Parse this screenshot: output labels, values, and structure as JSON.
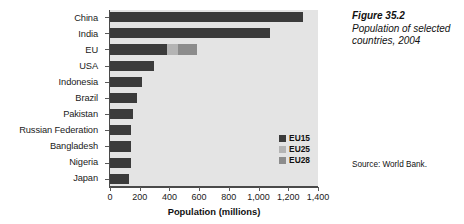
{
  "figure": {
    "number": "Figure 35.2",
    "title": "Population of selected countries, 2004",
    "source": "Source: World Bank."
  },
  "legend": {
    "position": "inside-right",
    "items": [
      {
        "label": "EU15",
        "color": "#3b3b3b"
      },
      {
        "label": "EU25",
        "color": "#b4b4b4"
      },
      {
        "label": "EU28",
        "color": "#8c8c8c"
      }
    ]
  },
  "chart_data": {
    "type": "bar",
    "orientation": "horizontal",
    "title": "Population of selected countries, 2004",
    "xlabel": "Population (millions)",
    "ylabel": "",
    "xlim": [
      0,
      1400
    ],
    "xticks": [
      0,
      200,
      400,
      600,
      800,
      1000,
      1200,
      1400
    ],
    "xtick_labels": [
      "0",
      "200",
      "400",
      "600",
      "800",
      "1,000",
      "1,200",
      "1,400"
    ],
    "grid": false,
    "plot_background": "#e4e4e4",
    "categories": [
      "China",
      "India",
      "EU",
      "USA",
      "Indonesia",
      "Brazil",
      "Pakistan",
      "Russian Federation",
      "Bangladesh",
      "Nigeria",
      "Japan"
    ],
    "series": [
      {
        "name": "EU15",
        "color": "#3b3b3b",
        "values": [
          1296,
          1080,
          385,
          294,
          218,
          179,
          152,
          144,
          140,
          139,
          128
        ]
      },
      {
        "name": "EU25",
        "color": "#b4b4b4",
        "values": [
          0,
          0,
          74,
          0,
          0,
          0,
          0,
          0,
          0,
          0,
          0
        ]
      },
      {
        "name": "EU28",
        "color": "#8c8c8c",
        "values": [
          0,
          0,
          129,
          0,
          0,
          0,
          0,
          0,
          0,
          0,
          0
        ]
      }
    ],
    "totals": [
      1296,
      1080,
      588,
      294,
      218,
      179,
      152,
      144,
      140,
      139,
      128
    ]
  }
}
